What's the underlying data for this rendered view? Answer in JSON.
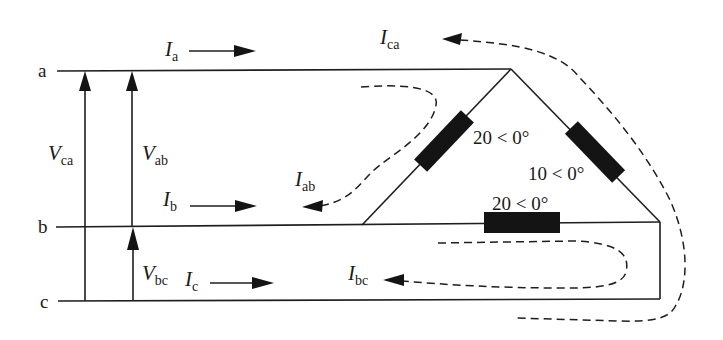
{
  "nodes": {
    "a": "a",
    "b": "b",
    "c": "c"
  },
  "voltages": {
    "ca": {
      "main": "V",
      "sub": "ca"
    },
    "ab": {
      "main": "V",
      "sub": "ab"
    },
    "bc": {
      "main": "V",
      "sub": "bc"
    }
  },
  "line_currents": {
    "a": {
      "main": "I",
      "sub": "a"
    },
    "b": {
      "main": "I",
      "sub": "b"
    },
    "c": {
      "main": "I",
      "sub": "c"
    }
  },
  "phase_currents": {
    "ab": {
      "main": "I",
      "sub": "ab"
    },
    "bc": {
      "main": "I",
      "sub": "bc"
    },
    "ca": {
      "main": "I",
      "sub": "ca"
    }
  },
  "impedances": {
    "ab": "20 < 0°",
    "ca": "10 < 0°",
    "bc": "20 < 0°"
  },
  "colors": {
    "line": "#1e1e1e",
    "resistor": "#141414",
    "background": "#ffffff"
  }
}
